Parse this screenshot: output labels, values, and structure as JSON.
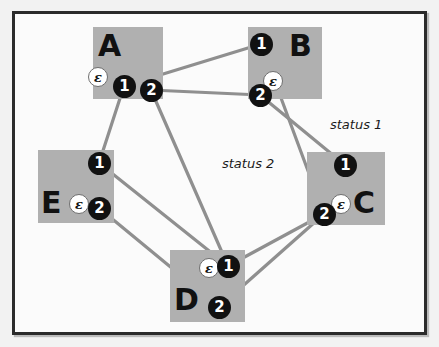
{
  "figure": {
    "background_color": "#f2f2f2",
    "frame_color": "#2b2b2b",
    "box_color": "#b0b0b0",
    "edge_color": "#8f8f8f",
    "port_color": "#111111",
    "epsilon_color": "#ffffff"
  },
  "nodes": [
    {
      "id": "A",
      "label": "A",
      "box": {
        "x": 93,
        "y": 27,
        "w": 70,
        "h": 72
      },
      "label_pos": {
        "x": 98,
        "y": 31
      },
      "ports": [
        {
          "name": "1",
          "label": "1",
          "x": 113,
          "y": 75
        },
        {
          "name": "2",
          "label": "2",
          "x": 140,
          "y": 79
        }
      ],
      "epsilon": {
        "label": "ε",
        "x": 88,
        "y": 67
      }
    },
    {
      "id": "B",
      "label": "B",
      "box": {
        "x": 248,
        "y": 27,
        "w": 74,
        "h": 72
      },
      "label_pos": {
        "x": 289,
        "y": 31
      },
      "ports": [
        {
          "name": "1",
          "label": "1",
          "x": 250,
          "y": 33
        },
        {
          "name": "2",
          "label": "2",
          "x": 249,
          "y": 84
        }
      ],
      "epsilon": {
        "label": "ε",
        "x": 263,
        "y": 71
      }
    },
    {
      "id": "C",
      "label": "C",
      "box": {
        "x": 307,
        "y": 152,
        "w": 78,
        "h": 73
      },
      "label_pos": {
        "x": 353,
        "y": 188
      },
      "ports": [
        {
          "name": "1",
          "label": "1",
          "x": 334,
          "y": 154
        },
        {
          "name": "2",
          "label": "2",
          "x": 313,
          "y": 203
        }
      ],
      "epsilon": {
        "label": "ε",
        "x": 331,
        "y": 194
      }
    },
    {
      "id": "D",
      "label": "D",
      "box": {
        "x": 170,
        "y": 250,
        "w": 75,
        "h": 72
      },
      "label_pos": {
        "x": 174,
        "y": 285
      },
      "ports": [
        {
          "name": "1",
          "label": "1",
          "x": 217,
          "y": 255
        },
        {
          "name": "2",
          "label": "2",
          "x": 208,
          "y": 296
        }
      ],
      "epsilon": {
        "label": "ε",
        "x": 199,
        "y": 258
      }
    },
    {
      "id": "E",
      "label": "E",
      "box": {
        "x": 38,
        "y": 150,
        "w": 76,
        "h": 73
      },
      "label_pos": {
        "x": 41,
        "y": 188
      },
      "ports": [
        {
          "name": "1",
          "label": "1",
          "x": 88,
          "y": 152
        },
        {
          "name": "2",
          "label": "2",
          "x": 88,
          "y": 197
        }
      ],
      "epsilon": {
        "label": "ε",
        "x": 69,
        "y": 194
      }
    }
  ],
  "edges": [
    {
      "from": "A.1",
      "to": "B.1",
      "x1": 124,
      "y1": 86,
      "x2": 261,
      "y2": 44
    },
    {
      "from": "A.2",
      "to": "B.2",
      "x1": 151,
      "y1": 90,
      "x2": 260,
      "y2": 95
    },
    {
      "from": "A.1",
      "to": "E.1",
      "x1": 124,
      "y1": 86,
      "x2": 99,
      "y2": 163
    },
    {
      "from": "A.2",
      "to": "D.1",
      "x1": 151,
      "y1": 90,
      "x2": 228,
      "y2": 266
    },
    {
      "from": "B.1",
      "to": "C.2",
      "x1": 261,
      "y1": 44,
      "x2": 324,
      "y2": 214
    },
    {
      "from": "B.2",
      "to": "C.1",
      "x1": 260,
      "y1": 95,
      "x2": 345,
      "y2": 165
    },
    {
      "from": "C.2",
      "to": "D.1",
      "x1": 324,
      "y1": 214,
      "x2": 228,
      "y2": 266
    },
    {
      "from": "C.2",
      "to": "D.2",
      "x1": 324,
      "y1": 214,
      "x2": 219,
      "y2": 307
    },
    {
      "from": "E.1",
      "to": "D.1",
      "x1": 99,
      "y1": 163,
      "x2": 228,
      "y2": 266
    },
    {
      "from": "E.2",
      "to": "D.2",
      "x1": 99,
      "y1": 208,
      "x2": 219,
      "y2": 307
    }
  ],
  "annotations": [
    {
      "name": "status-1",
      "text": "status 1",
      "x": 330,
      "y": 117
    },
    {
      "name": "status-2",
      "text": "status 2",
      "x": 222,
      "y": 156
    }
  ]
}
